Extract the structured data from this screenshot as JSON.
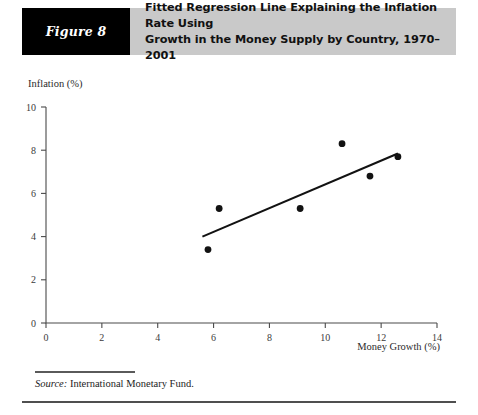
{
  "figure": {
    "tag": "Figure 8",
    "title_line1": "Fitted Regression Line Explaining the Inflation Rate Using",
    "title_line2": "Growth in the Money Supply by Country, 1970–2001",
    "tag_background": "#000000",
    "header_background": "#c9c9c9"
  },
  "source": {
    "label": "Source:",
    "text": "International Monetary Fund."
  },
  "chart_data": {
    "type": "scatter",
    "title": "Fitted Regression Line Explaining the Inflation Rate Using Growth in the Money Supply by Country, 1970–2001",
    "xlabel": "Money Growth (%)",
    "ylabel": "Inflation (%)",
    "xlim": [
      0,
      14
    ],
    "ylim": [
      0,
      10
    ],
    "xticks": [
      0,
      2,
      4,
      6,
      8,
      10,
      12,
      14
    ],
    "yticks": [
      0,
      2,
      4,
      6,
      8,
      10
    ],
    "xtick_labels": [
      "0",
      "2",
      "4",
      "6",
      "8",
      "10",
      "12",
      "14"
    ],
    "ytick_labels": [
      "0",
      "2",
      "4",
      "6",
      "8",
      "10"
    ],
    "grid": false,
    "legend": null,
    "point_color": "#121212",
    "line_color": "#121212",
    "points": [
      {
        "x": 5.8,
        "y": 3.4
      },
      {
        "x": 6.2,
        "y": 5.3
      },
      {
        "x": 9.1,
        "y": 5.3
      },
      {
        "x": 10.6,
        "y": 8.3
      },
      {
        "x": 11.6,
        "y": 6.8
      },
      {
        "x": 12.6,
        "y": 7.7
      }
    ],
    "series": [
      {
        "name": "Fitted regression line",
        "type": "line",
        "x": [
          5.6,
          12.6
        ],
        "y": [
          4.0,
          7.85
        ]
      }
    ]
  }
}
